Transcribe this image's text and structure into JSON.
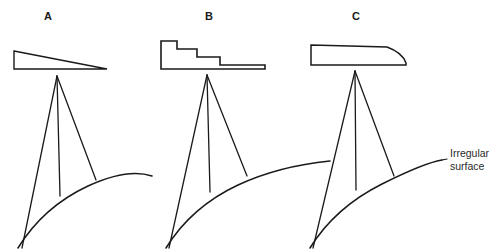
{
  "figure": {
    "background_color": "#ffffff",
    "ink_color": "#1a1a1a",
    "width": 498,
    "height": 251
  },
  "panels": [
    {
      "id": "panel-a",
      "label": "A",
      "label_x": 48,
      "label_y": 17,
      "aperture_type": "tapered-wedge",
      "aperture_name": "tapered wedge illumination taper",
      "aperture_outline": "14,51 107,69 14,69",
      "apex_x": 57,
      "apex_y": 76,
      "beams": [
        {
          "name": "beam-left",
          "x1": 57,
          "y1": 76,
          "x2": 22,
          "y2": 248
        },
        {
          "name": "beam-center",
          "x1": 57,
          "y1": 76,
          "x2": 60,
          "y2": 196
        },
        {
          "name": "beam-right",
          "x1": 57,
          "y1": 76,
          "x2": 96,
          "y2": 180
        }
      ],
      "surface_path": "M 18 248 C 34 222 58 200 88 186 C 112 175 134 170 152 176"
    },
    {
      "id": "panel-b",
      "label": "B",
      "label_x": 209,
      "label_y": 17,
      "aperture_type": "stepped-staircase",
      "aperture_name": "stepped staircase illumination taper",
      "aperture_outline": "161,41 177,41 177,49 197,49 197,57 220,57 220,65 265,65 265,69 161,69",
      "apex_x": 207,
      "apex_y": 75,
      "beams": [
        {
          "name": "beam-left",
          "x1": 207,
          "y1": 75,
          "x2": 169,
          "y2": 248
        },
        {
          "name": "beam-center",
          "x1": 207,
          "y1": 75,
          "x2": 210,
          "y2": 192
        },
        {
          "name": "beam-right",
          "x1": 207,
          "y1": 75,
          "x2": 247,
          "y2": 176
        }
      ],
      "surface_path": "M 166 248 C 182 222 206 200 238 185 C 266 172 300 164 330 161"
    },
    {
      "id": "panel-c",
      "label": "C",
      "label_x": 356,
      "label_y": 17,
      "aperture_type": "curved-airfoil",
      "aperture_name": "curved airfoil illumination taper",
      "aperture_outline": "M 311 45 L 387 47 C 398 51 404 57 406 63 L 406 65 L 311 65 Z",
      "apex_x": 355,
      "apex_y": 71,
      "beams": [
        {
          "name": "beam-left",
          "x1": 355,
          "y1": 71,
          "x2": 313,
          "y2": 248
        },
        {
          "name": "beam-center",
          "x1": 355,
          "y1": 71,
          "x2": 356,
          "y2": 190
        },
        {
          "name": "beam-right",
          "x1": 355,
          "y1": 71,
          "x2": 394,
          "y2": 176
        }
      ],
      "surface_path": "M 310 248 C 326 222 350 200 382 184 C 410 170 430 162 442 160"
    }
  ],
  "annotation": {
    "name": "irregular-surface-label",
    "line1": "Irregular",
    "line2": "surface",
    "text_x": 450,
    "text_y1": 157,
    "text_y2": 170,
    "leader_line": {
      "x1": 442,
      "y1": 160,
      "x2": 447,
      "y2": 159
    }
  }
}
